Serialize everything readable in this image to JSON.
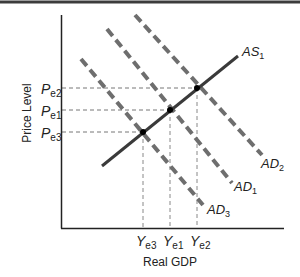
{
  "figure": {
    "y_axis_label": "Price Level",
    "x_axis_label": "Real GDP",
    "colors": {
      "axis": "#222222",
      "as_curve": "#3a3a3a",
      "ad_curves": "#6e6e6e",
      "guide_lines": "#777777",
      "points": "#000000",
      "top_rule": "#3c3c3c"
    },
    "price_labels": [
      {
        "main": "P",
        "sub": "e2"
      },
      {
        "main": "P",
        "sub": "e1"
      },
      {
        "main": "P",
        "sub": "e3"
      }
    ],
    "output_labels": [
      {
        "main": "Y",
        "sub": "e3"
      },
      {
        "main": "Y",
        "sub": "e1"
      },
      {
        "main": "Y",
        "sub": "e2"
      }
    ],
    "curves": {
      "as1": {
        "main": "AS",
        "sub": "1",
        "style": "solid"
      },
      "ad1": {
        "main": "AD",
        "sub": "1",
        "style": "dashed"
      },
      "ad2": {
        "main": "AD",
        "sub": "2",
        "style": "dashed"
      },
      "ad3": {
        "main": "AD",
        "sub": "3",
        "style": "dashed"
      }
    },
    "equilibria": [
      {
        "name": "e3",
        "price": "Pe3",
        "output": "Ye3"
      },
      {
        "name": "e1",
        "price": "Pe1",
        "output": "Ye1"
      },
      {
        "name": "e2",
        "price": "Pe2",
        "output": "Ye2"
      }
    ]
  }
}
